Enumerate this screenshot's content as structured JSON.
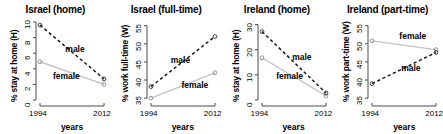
{
  "figure": {
    "panel_count": 4,
    "marker": "open-circle",
    "male_line_style": "dashed",
    "female_line_style": "solid",
    "male_color": "#1a1a1a",
    "female_color": "#c4c4c4",
    "axis_color": "#4d4d4d"
  },
  "chart_data": [
    {
      "type": "line",
      "title": "Israel (home)",
      "xlabel": "years",
      "ylabel": "% stay at home (H)",
      "x": [
        1994,
        2012
      ],
      "xlim": [
        1994,
        2012
      ],
      "xticks": [
        1994,
        2012
      ],
      "xticklabels": [
        "1994",
        "2012"
      ],
      "ylim": [
        0,
        10
      ],
      "yticks": [
        0,
        2,
        4,
        6,
        8,
        10
      ],
      "yticklabels": [
        "0",
        "2",
        "4",
        "6",
        "8",
        "10"
      ],
      "grid": false,
      "legend": "inline-annotations",
      "series": [
        {
          "name": "male",
          "values": [
            9.6,
            2.7
          ],
          "style": "dashed",
          "color": "#1a1a1a"
        },
        {
          "name": "female",
          "values": [
            4.9,
            2.0
          ],
          "style": "solid",
          "color": "#c4c4c4"
        }
      ],
      "annotations": [
        {
          "text": "male",
          "x": 2004.5,
          "y": 6.4
        },
        {
          "text": "female",
          "x": 2001.0,
          "y": 3.0
        }
      ]
    },
    {
      "type": "line",
      "title": "Israel (full-time)",
      "xlabel": "years",
      "ylabel": "% work full-time (W)",
      "x": [
        1994,
        2012
      ],
      "xlim": [
        1994,
        2012
      ],
      "xticks": [
        1994,
        2012
      ],
      "xticklabels": [
        "1994",
        "2012"
      ],
      "ylim": [
        34.5,
        56
      ],
      "yticks": [
        35,
        40,
        45,
        50,
        55
      ],
      "yticklabels": [
        "35",
        "40",
        "45",
        "50",
        "55"
      ],
      "grid": false,
      "legend": "inline-annotations",
      "series": [
        {
          "name": "male",
          "values": [
            38.2,
            52.0
          ],
          "style": "dashed",
          "color": "#1a1a1a"
        },
        {
          "name": "female",
          "values": [
            35.0,
            42.0
          ],
          "style": "solid",
          "color": "#c4c4c4"
        }
      ],
      "annotations": [
        {
          "text": "male",
          "x": 2003.0,
          "y": 45.3
        },
        {
          "text": "female",
          "x": 2006.0,
          "y": 38.4
        }
      ]
    },
    {
      "type": "line",
      "title": "Ireland (home)",
      "xlabel": "years",
      "ylabel": "% stay at home (H)",
      "x": [
        1994,
        2012
      ],
      "xlim": [
        1994,
        2012
      ],
      "xticks": [
        1994,
        2012
      ],
      "xticklabels": [
        "1994",
        "2012"
      ],
      "ylim": [
        0,
        31
      ],
      "yticks": [
        0,
        10,
        20,
        30
      ],
      "yticklabels": [
        "0",
        "10",
        "20",
        "30"
      ],
      "grid": false,
      "legend": "inline-annotations",
      "series": [
        {
          "name": "male",
          "values": [
            27.2,
            2.8
          ],
          "style": "dashed",
          "color": "#1a1a1a"
        },
        {
          "name": "female",
          "values": [
            16.8,
            1.6
          ],
          "style": "solid",
          "color": "#c4c4c4"
        }
      ],
      "annotations": [
        {
          "text": "male",
          "x": 2006.0,
          "y": 16.5
        },
        {
          "text": "female",
          "x": 2001.5,
          "y": 9.0
        }
      ]
    },
    {
      "type": "line",
      "title": "Ireland (part-time)",
      "xlabel": "years",
      "ylabel": "% work part-time (W)",
      "x": [
        1994,
        2012
      ],
      "xlim": [
        1994,
        2012
      ],
      "xticks": [
        1994,
        2012
      ],
      "xticklabels": [
        "1994",
        "2012"
      ],
      "ylim": [
        34.5,
        56
      ],
      "yticks": [
        35,
        40,
        45,
        50,
        55
      ],
      "yticklabels": [
        "35",
        "40",
        "45",
        "50",
        "55"
      ],
      "grid": false,
      "legend": "inline-annotations",
      "series": [
        {
          "name": "male",
          "values": [
            39.0,
            47.6
          ],
          "style": "dashed",
          "color": "#1a1a1a"
        },
        {
          "name": "female",
          "values": [
            50.8,
            48.4
          ],
          "style": "solid",
          "color": "#c4c4c4"
        }
      ],
      "annotations": [
        {
          "text": "female",
          "x": 2005.0,
          "y": 51.8
        },
        {
          "text": "male",
          "x": 2005.5,
          "y": 43.0
        }
      ]
    }
  ]
}
